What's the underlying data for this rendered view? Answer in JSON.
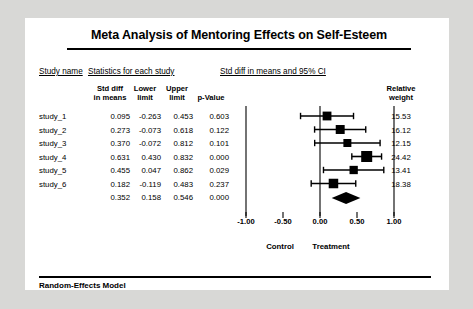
{
  "title": "Meta Analysis of Mentoring Effects on Self-Esteem",
  "group_headers": {
    "study_name": "Study name",
    "statistics": "Statistics for each study",
    "ci": "Std diff in means and 95% CI"
  },
  "column_headers": {
    "std_diff": "Std diff\nin means",
    "std_diff_l1": "Std diff",
    "std_diff_l2": "in means",
    "lower_l1": "Lower",
    "lower_l2": "limit",
    "upper_l1": "Upper",
    "upper_l2": "limit",
    "p_value": "p-Value",
    "relative_l1": "Relative",
    "relative_l2": "weight"
  },
  "rows": [
    {
      "name": "study_1",
      "std_diff": "0.095",
      "lower": "-0.263",
      "upper": "0.453",
      "p_value": "0.603",
      "weight": "15.53"
    },
    {
      "name": "study_2",
      "std_diff": "0.273",
      "lower": "-0.073",
      "upper": "0.618",
      "p_value": "0.122",
      "weight": "16.12"
    },
    {
      "name": "study_3",
      "std_diff": "0.370",
      "lower": "-0.072",
      "upper": "0.812",
      "p_value": "0.101",
      "weight": "12.15"
    },
    {
      "name": "study_4",
      "std_diff": "0.631",
      "lower": "0.430",
      "upper": "0.832",
      "p_value": "0.000",
      "weight": "24.42"
    },
    {
      "name": "study_5",
      "std_diff": "0.455",
      "lower": "0.047",
      "upper": "0.862",
      "p_value": "0.029",
      "weight": "13.41"
    },
    {
      "name": "study_6",
      "std_diff": "0.182",
      "lower": "-0.119",
      "upper": "0.483",
      "p_value": "0.237",
      "weight": "18.38"
    }
  ],
  "summary": {
    "name": "",
    "std_diff": "0.352",
    "lower": "0.158",
    "upper": "0.546",
    "p_value": "0.000",
    "weight": ""
  },
  "axis": {
    "ticks": [
      "-1.00",
      "-0.50",
      "0.00",
      "0.50",
      "1.00"
    ],
    "favors_left": "Control",
    "favors_right": "Treatment"
  },
  "footer": "Random-Effects Model",
  "chart_data": {
    "type": "forest",
    "title": "Meta Analysis of Mentoring Effects on Self-Esteem",
    "xlabel": "Std diff in means and 95% CI",
    "xlim": [
      -1.25,
      1.25
    ],
    "xticks": [
      -1.0,
      -0.5,
      0.0,
      0.5,
      1.0
    ],
    "reference_line": 0.0,
    "model": "Random-Effects Model",
    "favors_left": "Control",
    "favors_right": "Treatment",
    "studies": [
      {
        "name": "study_1",
        "effect": 0.095,
        "lower": -0.263,
        "upper": 0.453,
        "p_value": 0.603,
        "weight": 15.53
      },
      {
        "name": "study_2",
        "effect": 0.273,
        "lower": -0.073,
        "upper": 0.618,
        "p_value": 0.122,
        "weight": 16.12
      },
      {
        "name": "study_3",
        "effect": 0.37,
        "lower": -0.072,
        "upper": 0.812,
        "p_value": 0.101,
        "weight": 12.15
      },
      {
        "name": "study_4",
        "effect": 0.631,
        "lower": 0.43,
        "upper": 0.832,
        "p_value": 0.0,
        "weight": 24.42
      },
      {
        "name": "study_5",
        "effect": 0.455,
        "lower": 0.047,
        "upper": 0.862,
        "p_value": 0.029,
        "weight": 13.41
      },
      {
        "name": "study_6",
        "effect": 0.182,
        "lower": -0.119,
        "upper": 0.483,
        "p_value": 0.237,
        "weight": 18.38
      }
    ],
    "overall": {
      "effect": 0.352,
      "lower": 0.158,
      "upper": 0.546,
      "p_value": 0.0
    }
  }
}
